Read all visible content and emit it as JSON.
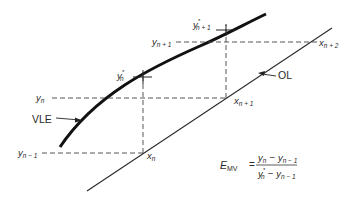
{
  "diagram": {
    "type": "McCabe-Thiele stage construction (Murphree vapor efficiency)",
    "curves": {
      "vle": {
        "label": "VLE",
        "color": "#1a1a1a"
      },
      "operating_line": {
        "label": "OL",
        "color": "#2a2a2a"
      }
    },
    "points": {
      "y_n_minus_1": {
        "base": "y",
        "sub": "n − 1"
      },
      "y_n": {
        "base": "y",
        "sub": "n"
      },
      "y_n_star": {
        "base": "y",
        "sup": "*",
        "sub": "n"
      },
      "y_n_plus_1": {
        "base": "y",
        "sub": "n + 1"
      },
      "y_n_plus_1_star": {
        "base": "y",
        "sup": "*",
        "sub": "n + 1"
      },
      "x_n": {
        "base": "x",
        "sub": "n"
      },
      "x_n_plus_1": {
        "base": "x",
        "sub": "n + 1"
      },
      "x_n_plus_2": {
        "base": "x",
        "sub": "n + 2"
      }
    },
    "equation": {
      "lhs_base": "E",
      "lhs_sub": "MV",
      "equals": "=",
      "numerator": "y_n − y_{n−1}",
      "denominator": "y*_n − y_{n−1}",
      "num_a": "y",
      "num_a_sub": "n",
      "minus": "−",
      "num_b": "y",
      "num_b_sub": "n − 1",
      "den_a": "y",
      "den_a_sup": "*",
      "den_a_sub": "n",
      "den_b": "y",
      "den_b_sub": "n − 1"
    }
  }
}
